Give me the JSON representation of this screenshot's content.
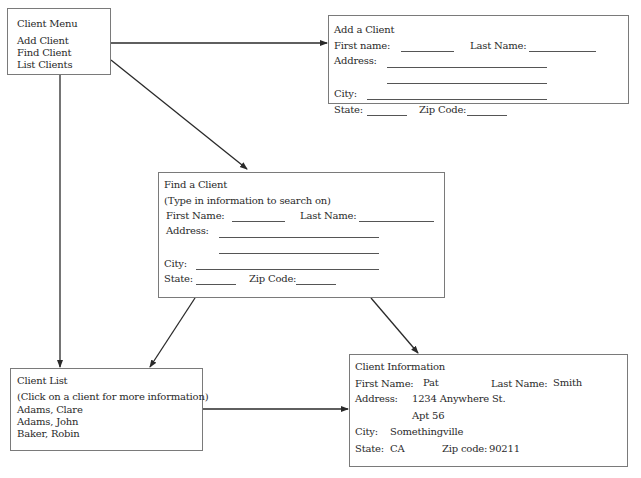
{
  "client_menu": {
    "title": "Client Menu",
    "items": [
      {
        "label": "Add Client"
      },
      {
        "label": "Find Client"
      },
      {
        "label": "List Clients"
      }
    ]
  },
  "add_client": {
    "title": "Add a Client",
    "first_name_label": "First name:",
    "last_name_label": "Last Name:",
    "address_label": "Address:",
    "city_label": "City:",
    "state_label": "State:",
    "zip_label": "Zip Code:"
  },
  "find_client": {
    "title": "Find a Client",
    "subtitle": "(Type in information to search on)",
    "first_name_label": "First Name:",
    "last_name_label": "Last Name:",
    "address_label": "Address:",
    "city_label": "City:",
    "state_label": "State:",
    "zip_label": "Zip Code:"
  },
  "client_list": {
    "title": "Client List",
    "subtitle": "(Click on a client for more information)",
    "clients": [
      {
        "name": "Adams, Clare"
      },
      {
        "name": "Adams, John"
      },
      {
        "name": "Baker, Robin"
      }
    ]
  },
  "client_info": {
    "title": "Client Information",
    "first_name_label": "First Name:",
    "first_name_value": "Pat",
    "last_name_label": "Last Name:",
    "last_name_value": "Smith",
    "address_label": "Address:",
    "address_line1": "1234 Anywhere St.",
    "address_line2": "Apt 56",
    "city_label": "City:",
    "city_value": "Somethingville",
    "state_label": "State:",
    "state_value": "CA",
    "zip_label": "Zip code:",
    "zip_value": "90211"
  },
  "colors": {
    "border": "#7a7a7a",
    "arrow": "#2a2a2a",
    "text": "#2a2a2a"
  }
}
